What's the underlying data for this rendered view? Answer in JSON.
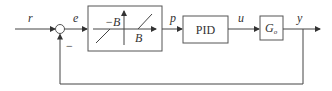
{
  "diagram": {
    "type": "block_diagram",
    "signals": {
      "reference": "r",
      "error": "e",
      "deadzone_output": "p",
      "control": "u",
      "output": "y"
    },
    "summing_junction": {
      "feedback_sign": "−"
    },
    "blocks": [
      {
        "id": "deadzone",
        "kind": "dead-zone nonlinearity",
        "labels": {
          "neg": "−B",
          "pos": "B"
        }
      },
      {
        "id": "pid",
        "kind": "controller",
        "label": "PID"
      },
      {
        "id": "plant",
        "kind": "plant",
        "label": "G",
        "subscript": "o"
      }
    ],
    "connections": [
      [
        "r",
        "summing_junction"
      ],
      [
        "summing_junction",
        "deadzone",
        "e"
      ],
      [
        "deadzone",
        "pid",
        "p"
      ],
      [
        "pid",
        "plant",
        "u"
      ],
      [
        "plant",
        "output",
        "y"
      ],
      [
        "output",
        "summing_junction",
        "feedback (−)"
      ]
    ],
    "colors": {
      "line": "#444444",
      "background": "#ffffff"
    }
  }
}
